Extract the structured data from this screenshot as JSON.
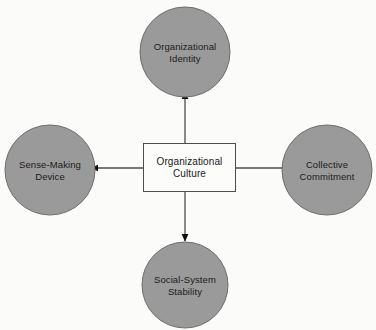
{
  "diagram": {
    "type": "hub-and-spoke",
    "background_color": "#fbfbf9",
    "center": {
      "id": "organizational-culture",
      "label": "Organizational\nCulture",
      "shape": "rectangle",
      "fill_color": "#fcfcfa",
      "border_color": "#4d4d4d",
      "x": 143,
      "y": 143,
      "width": 93,
      "height": 49
    },
    "nodes": [
      {
        "id": "organizational-identity",
        "label": "Organizational\nIdentity",
        "shape": "circle",
        "fill_color": "#9a9a9a",
        "border_color": "#6e6e6e",
        "cx": 185,
        "cy": 52,
        "r": 45,
        "position": "top"
      },
      {
        "id": "sense-making-device",
        "label": "Sense-Making\nDevice",
        "shape": "circle",
        "fill_color": "#9a9a9a",
        "border_color": "#6e6e6e",
        "cx": 50,
        "cy": 170,
        "r": 45,
        "position": "left"
      },
      {
        "id": "collective-commitment",
        "label": "Collective\nCommitment",
        "shape": "circle",
        "fill_color": "#9a9a9a",
        "border_color": "#6e6e6e",
        "cx": 327,
        "cy": 170,
        "r": 45,
        "position": "right"
      },
      {
        "id": "social-system-stability",
        "label": "Social-System\nStability",
        "shape": "circle",
        "fill_color": "#9a9a9a",
        "border_color": "#6e6e6e",
        "cx": 185,
        "cy": 285,
        "r": 43,
        "position": "bottom"
      }
    ],
    "connectors": [
      {
        "id": "arrow-to-identity",
        "from": "organizational-culture",
        "to": "organizational-identity",
        "direction": "up",
        "color": "#4d4d4d",
        "arrowhead": "solid-triangle"
      },
      {
        "id": "arrow-to-sense-making",
        "from": "organizational-culture",
        "to": "sense-making-device",
        "direction": "left",
        "color": "#4d4d4d",
        "arrowhead": "solid-triangle"
      },
      {
        "id": "arrow-to-collective-commitment",
        "from": "organizational-culture",
        "to": "collective-commitment",
        "direction": "right",
        "color": "#4d4d4d",
        "arrowhead": "solid-triangle"
      },
      {
        "id": "arrow-to-stability",
        "from": "organizational-culture",
        "to": "social-system-stability",
        "direction": "down",
        "color": "#4d4d4d",
        "arrowhead": "solid-triangle"
      }
    ]
  }
}
